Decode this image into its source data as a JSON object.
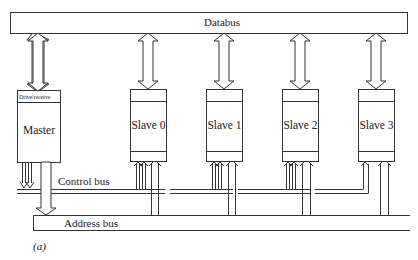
{
  "diagram": {
    "type": "bus-architecture",
    "caption": "(a)",
    "buses": {
      "databus": {
        "label": "Databus"
      },
      "control_bus": {
        "label": "Control bus"
      },
      "address_bus": {
        "label": "Address bus"
      }
    },
    "master": {
      "label": "Master",
      "interface_label": "Drive/receive"
    },
    "slaves": [
      {
        "label": "Slave 0"
      },
      {
        "label": "Slave 1"
      },
      {
        "label": "Slave 2"
      },
      {
        "label": "Slave 3"
      }
    ],
    "connections": [
      {
        "from": "master",
        "to": "databus",
        "kind": "bidirectional"
      },
      {
        "from": "slave-0",
        "to": "databus",
        "kind": "bidirectional"
      },
      {
        "from": "slave-1",
        "to": "databus",
        "kind": "bidirectional"
      },
      {
        "from": "slave-2",
        "to": "databus",
        "kind": "bidirectional"
      },
      {
        "from": "slave-3",
        "to": "databus",
        "kind": "bidirectional"
      },
      {
        "from": "master",
        "to": "control_bus",
        "kind": "output"
      },
      {
        "from": "master",
        "to": "address_bus",
        "kind": "output"
      },
      {
        "from": "control_bus",
        "to": "slaves",
        "kind": "input"
      },
      {
        "from": "address_bus",
        "to": "slaves",
        "kind": "input"
      }
    ]
  }
}
